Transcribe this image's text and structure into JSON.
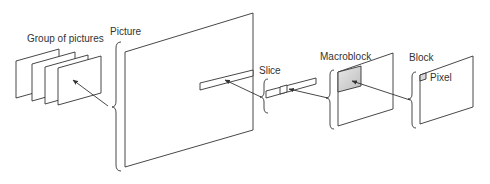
{
  "diagram": {
    "labels": {
      "gop": "Group of pictures",
      "picture": "Picture",
      "slice": "Slice",
      "macroblock": "Macroblock",
      "block": "Block",
      "pixel": "Pixel"
    },
    "colors": {
      "stroke": "#333333",
      "macroblock_fill": "#cfcfcf",
      "pixel_fill": "#d8d8d8",
      "background": "#ffffff"
    },
    "hierarchy": [
      "Group of pictures",
      "Picture",
      "Slice",
      "Macroblock",
      "Block",
      "Pixel"
    ]
  }
}
